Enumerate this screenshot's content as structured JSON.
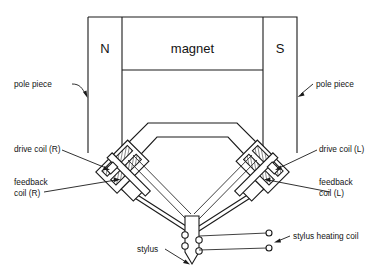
{
  "figure": {
    "type": "technical-cross-section-diagram",
    "background_color": "#ffffff",
    "line_color": "#1a1a1a"
  },
  "magnet_assembly": {
    "magnet_label": "magnet",
    "north_pole_label": "N",
    "south_pole_label": "S"
  },
  "labels": {
    "pole_piece_left": "pole piece",
    "pole_piece_right": "pole piece",
    "drive_coil_right": "drive coil (R)",
    "drive_coil_left": "drive coil (L)",
    "feedback_coil_right_line1": "feedback",
    "feedback_coil_right_line2": "coil (R)",
    "feedback_coil_left_line1": "feedback",
    "feedback_coil_left_line2": "coil (L)",
    "stylus": "stylus",
    "stylus_heating_coil": "stylus heating coil"
  },
  "components": [
    {
      "name": "magnet",
      "label": "magnet"
    },
    {
      "name": "north-pole-piece",
      "label": "N"
    },
    {
      "name": "south-pole-piece",
      "label": "S"
    },
    {
      "name": "drive-coil-right",
      "label": "drive coil (R)"
    },
    {
      "name": "feedback-coil-right",
      "label": "feedback coil (R)"
    },
    {
      "name": "drive-coil-left",
      "label": "drive coil (L)"
    },
    {
      "name": "feedback-coil-left",
      "label": "feedback coil (L)"
    },
    {
      "name": "stylus",
      "label": "stylus"
    },
    {
      "name": "stylus-heating-coil",
      "label": "stylus heating coil"
    }
  ]
}
